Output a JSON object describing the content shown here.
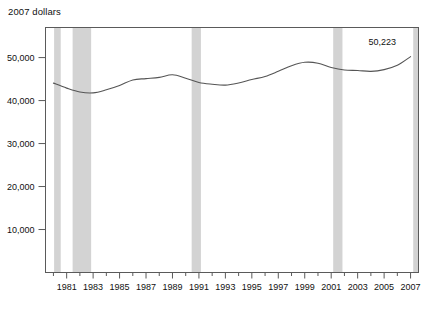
{
  "chart_data": {
    "type": "line",
    "title": "2007 dollars",
    "xlabel": "",
    "ylabel": "",
    "ylim": [
      0,
      57000
    ],
    "xlim": [
      1979.4,
      2007.6
    ],
    "grid": false,
    "legend": null,
    "y_ticks": [
      10000,
      20000,
      30000,
      40000,
      50000
    ],
    "y_tick_labels": [
      "10,000",
      "20,000",
      "30,000",
      "40,000",
      "50,000"
    ],
    "x_major_ticks": [
      1981,
      1983,
      1985,
      1987,
      1989,
      1991,
      1993,
      1995,
      1997,
      1999,
      2001,
      2003,
      2005,
      2007
    ],
    "x_major_tick_labels": [
      "1981",
      "1983",
      "1985",
      "1987",
      "1989",
      "1991",
      "1993",
      "1995",
      "1997",
      "1999",
      "2001",
      "2003",
      "2005",
      "2007"
    ],
    "x_minor_ticks": [
      1980,
      1982,
      1984,
      1986,
      1988,
      1990,
      1992,
      1994,
      1996,
      1998,
      2000,
      2002,
      2004,
      2006
    ],
    "x": [
      1980,
      1981,
      1982,
      1983,
      1984,
      1985,
      1986,
      1987,
      1988,
      1989,
      1990,
      1991,
      1992,
      1993,
      1994,
      1995,
      1996,
      1997,
      1998,
      1999,
      2000,
      2001,
      2002,
      2003,
      2004,
      2005,
      2006,
      2007
    ],
    "values": [
      44059,
      42900,
      42000,
      41800,
      42500,
      43500,
      44800,
      45100,
      45400,
      46000,
      45200,
      44200,
      43800,
      43600,
      44100,
      44900,
      45600,
      46800,
      48100,
      48900,
      48700,
      47700,
      47100,
      47000,
      46800,
      47200,
      48200,
      50223
    ],
    "series": [
      {
        "name": "Median income",
        "values": [
          44059,
          42900,
          42000,
          41800,
          42500,
          43500,
          44800,
          45100,
          45400,
          46000,
          45200,
          44200,
          43800,
          43600,
          44100,
          44900,
          45600,
          46800,
          48100,
          48900,
          48700,
          47700,
          47100,
          47000,
          46800,
          47200,
          48200,
          50223
        ]
      }
    ],
    "line_color": "#555555",
    "annotations": [
      {
        "text": "50,223",
        "x": 2007,
        "y": 50223
      }
    ],
    "shaded_bands": [
      {
        "label": "recession-1980",
        "start": 1980.05,
        "end": 1980.55
      },
      {
        "label": "recession-1981-1982",
        "start": 1981.45,
        "end": 1982.85
      },
      {
        "label": "recession-1990-1991",
        "start": 1990.45,
        "end": 1991.15
      },
      {
        "label": "recession-2001",
        "start": 2001.15,
        "end": 2001.85
      },
      {
        "label": "recession-2007",
        "start": 2007.2,
        "end": 2007.6
      }
    ],
    "band_color": "#d3d3d3",
    "plot_border_color": "#5a5a5a"
  }
}
